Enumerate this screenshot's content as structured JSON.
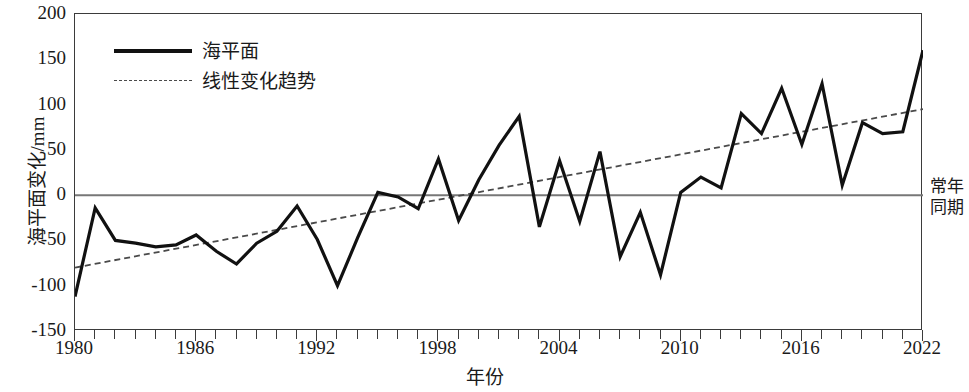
{
  "chart_data": {
    "type": "line",
    "title": "",
    "xlabel": "年份",
    "ylabel": "海平面变化/mm",
    "xlim": [
      1980,
      2022
    ],
    "ylim": [
      -150,
      200
    ],
    "ytick_values": [
      200,
      150,
      100,
      50,
      0,
      -50,
      -100,
      -150
    ],
    "ytick_labels": [
      "200",
      "150",
      "100",
      "50",
      "0",
      "-50",
      "-100",
      "-150"
    ],
    "xtick_values": [
      1980,
      1986,
      1992,
      1998,
      2004,
      2010,
      2016,
      2022
    ],
    "xtick_labels": [
      "1980",
      "1986",
      "1992",
      "1998",
      "2004",
      "2010",
      "2016",
      "2022"
    ],
    "xtick_step_minor": 1,
    "grid": false,
    "legend_position": "upper-left",
    "zero_reference_line": 0,
    "zero_reference_label": "常年同期",
    "x": [
      1980,
      1981,
      1982,
      1983,
      1984,
      1985,
      1986,
      1987,
      1988,
      1989,
      1990,
      1991,
      1992,
      1993,
      1994,
      1995,
      1996,
      1997,
      1998,
      1999,
      2000,
      2001,
      2002,
      2003,
      2004,
      2005,
      2006,
      2007,
      2008,
      2009,
      2010,
      2011,
      2012,
      2013,
      2014,
      2015,
      2016,
      2017,
      2018,
      2019,
      2020,
      2021,
      2022
    ],
    "series": [
      {
        "name": "海平面",
        "style": "solid",
        "color": "#111111",
        "values": [
          -112,
          -14,
          -50,
          -53,
          -57,
          -55,
          -44,
          -62,
          -76,
          -53,
          -40,
          -12,
          -49,
          -100,
          -47,
          3,
          -2,
          -15,
          40,
          -28,
          17,
          55,
          87,
          -35,
          38,
          -29,
          48,
          -68,
          -19,
          -88,
          3,
          20,
          8,
          90,
          68,
          118,
          56,
          123,
          11,
          80,
          68,
          70,
          160
        ]
      },
      {
        "name": "线性变化趋势",
        "style": "dashed",
        "color": "#4a4a4a",
        "endpoints": {
          "x0": 1980,
          "y0": -80,
          "x1": 2022,
          "y1": 95
        }
      }
    ]
  },
  "legend": {
    "items": [
      {
        "label": "海平面",
        "style": "solid"
      },
      {
        "label": "线性变化趋势",
        "style": "dashed"
      }
    ]
  },
  "annotation": {
    "line1": "常年",
    "line2": "同期"
  }
}
